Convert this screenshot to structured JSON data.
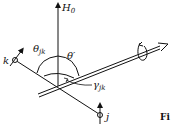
{
  "diagram": {
    "labels": {
      "field": "H",
      "field_sub": "0",
      "theta_jk": "θ",
      "theta_jk_sub": "jk",
      "theta_prime": "θ′",
      "gamma_jk": "γ",
      "gamma_jk_sub": "jk",
      "spin_k": "k",
      "spin_j": "j",
      "caption_fragment": "Fi"
    },
    "colors": {
      "ink": "#111111",
      "background": "#ffffff"
    }
  }
}
